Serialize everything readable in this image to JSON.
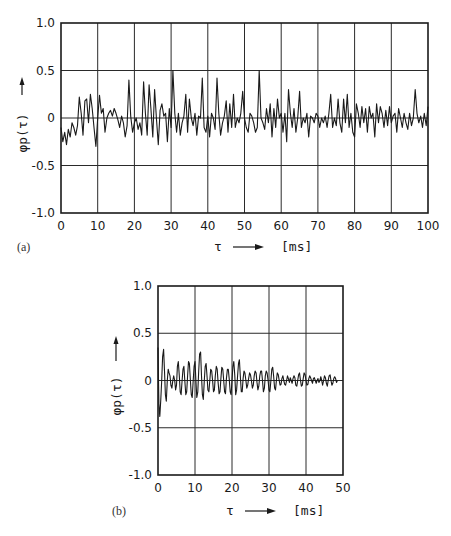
{
  "chart_data": [
    {
      "id": "a",
      "type": "line",
      "panel_label": "(a)",
      "title": "",
      "xlabel": "τ",
      "xunit": "[ms]",
      "ylabel": "φp(τ)",
      "xlim": [
        0,
        100
      ],
      "ylim": [
        -1.0,
        1.0
      ],
      "xticks": [
        0,
        10,
        20,
        30,
        40,
        50,
        60,
        70,
        80,
        90,
        100
      ],
      "xtick_labels": [
        "0",
        "10",
        "20",
        "30",
        "40",
        "50",
        "60",
        "70",
        "80",
        "90",
        "100"
      ],
      "yticks": [
        1.0,
        0.5,
        0,
        -0.5,
        -1.0
      ],
      "ytick_labels": [
        "1.0",
        "0.5",
        "0",
        "-0.5",
        "-1.0"
      ],
      "grid": true,
      "legend": "none",
      "series": [
        {
          "name": "φp(τ)",
          "x_step": 0.5,
          "values": [
            -0.1,
            -0.25,
            -0.15,
            -0.28,
            -0.12,
            -0.2,
            -0.05,
            -0.1,
            -0.18,
            -0.08,
            0.22,
            0.05,
            -0.18,
            0.18,
            0.2,
            -0.05,
            0.25,
            0.1,
            -0.1,
            -0.3,
            0.0,
            0.24,
            0.05,
            0.1,
            -0.15,
            0.0,
            0.05,
            0.08,
            0.02,
            0.1,
            0.05,
            -0.02,
            -0.1,
            0.02,
            -0.05,
            -0.2,
            -0.08,
            0.4,
            0.02,
            -0.15,
            -0.05,
            0.0,
            -0.12,
            -0.05,
            -0.18,
            0.38,
            0.05,
            -0.18,
            0.35,
            0.1,
            -0.2,
            0.3,
            0.0,
            -0.28,
            0.08,
            0.15,
            0.02,
            0.05,
            -0.25,
            0.1,
            -0.1,
            0.5,
            0.05,
            -0.15,
            0.05,
            -0.18,
            -0.05,
            0.02,
            0.25,
            -0.15,
            0.2,
            0.0,
            -0.08,
            0.05,
            -0.18,
            0.02,
            0.0,
            0.42,
            -0.1,
            -0.15,
            0.02,
            -0.2,
            0.05,
            0.0,
            -0.12,
            0.42,
            0.05,
            -0.18,
            -0.05,
            0.02,
            0.18,
            -0.15,
            0.15,
            -0.1,
            0.25,
            -0.1,
            0.0,
            -0.05,
            0.05,
            0.28,
            0.0,
            -0.1,
            -0.15,
            0.05,
            0.02,
            -0.05,
            -0.15,
            -0.1,
            0.5,
            0.0,
            -0.05,
            -0.12,
            0.1,
            -0.05,
            0.15,
            -0.2,
            0.1,
            -0.1,
            0.2,
            0.0,
            0.05,
            -0.15,
            0.05,
            -0.25,
            0.3,
            0.05,
            -0.1,
            0.1,
            -0.15,
            0.0,
            0.28,
            -0.1,
            0.0,
            -0.05,
            0.05,
            -0.2,
            0.02,
            0.0,
            -0.05,
            0.05,
            0.02,
            -0.1,
            0.0,
            -0.05,
            0.02,
            -0.1,
            0.05,
            0.25,
            -0.1,
            0.0,
            -0.08,
            0.2,
            -0.05,
            -0.15,
            0.2,
            -0.05,
            0.25,
            -0.1,
            0.05,
            -0.15,
            -0.2,
            0.15,
            0.05,
            -0.1,
            0.12,
            -0.05,
            0.1,
            -0.15,
            0.12,
            0.0,
            0.05,
            -0.2,
            0.15,
            -0.05,
            0.12,
            0.05,
            -0.1,
            0.08,
            -0.08,
            0.12,
            -0.05,
            0.02,
            0.05,
            -0.15,
            0.1,
            0.0,
            -0.1,
            0.05,
            -0.05,
            -0.12,
            0.05,
            -0.08,
            0.0,
            0.3,
            0.05,
            -0.05,
            0.02,
            -0.1,
            0.05,
            -0.08,
            0.12,
            -0.02,
            0.0,
            0.12,
            -0.05,
            -0.1,
            0.08,
            -0.05,
            0.02,
            -0.15,
            0.1,
            0.0,
            -0.08,
            0.05,
            0.0,
            -0.05,
            0.2,
            0.05,
            -0.05,
            0.1,
            -0.1,
            0.05,
            -0.02,
            0.08,
            -0.05,
            0.1,
            0.0,
            -0.1,
            0.08,
            -0.05,
            0.05,
            0.0,
            -0.08,
            0.08,
            -0.02,
            0.05,
            -0.05,
            0.0,
            0.08,
            -0.08,
            0.05,
            0.0,
            -0.05,
            0.1,
            -0.02,
            0.0,
            -0.08,
            0.08,
            -0.05,
            0.05,
            0.0,
            -0.05,
            0.05,
            -0.08,
            0.02,
            -0.1
          ],
          "color": "#1a1a1a"
        }
      ]
    },
    {
      "id": "b",
      "type": "line",
      "panel_label": "(b)",
      "title": "",
      "xlabel": "τ",
      "xunit": "[ms]",
      "ylabel": "φp(τ)",
      "xlim": [
        0,
        50
      ],
      "ylim": [
        -1.0,
        1.0
      ],
      "xticks": [
        0,
        10,
        20,
        30,
        40,
        50
      ],
      "xtick_labels": [
        "0",
        "10",
        "20",
        "30",
        "40",
        "50"
      ],
      "yticks": [
        1.0,
        0.5,
        0,
        -0.5,
        -1.0
      ],
      "ytick_labels": [
        "1.0",
        "0.5",
        "0",
        "-0.5",
        "-1.0"
      ],
      "grid": true,
      "legend": "none",
      "series": [
        {
          "name": "φp(τ)",
          "x_step": 0.25,
          "values": [
            0.35,
            -0.25,
            -0.38,
            -0.2,
            0.0,
            0.25,
            0.33,
            0.1,
            -0.15,
            -0.22,
            0.0,
            0.12,
            0.08,
            0.05,
            -0.05,
            -0.08,
            0.0,
            0.05,
            0.0,
            -0.1,
            -0.05,
            0.15,
            0.2,
            0.05,
            -0.12,
            -0.15,
            0.0,
            0.12,
            0.15,
            0.0,
            -0.15,
            -0.12,
            0.05,
            0.2,
            0.18,
            0.0,
            -0.15,
            -0.18,
            0.0,
            0.15,
            0.2,
            0.0,
            -0.18,
            -0.12,
            0.1,
            0.28,
            0.3,
            0.05,
            -0.15,
            -0.2,
            0.0,
            0.15,
            0.18,
            0.05,
            -0.1,
            -0.12,
            0.0,
            0.12,
            0.1,
            0.0,
            -0.12,
            -0.1,
            0.05,
            0.15,
            0.12,
            -0.02,
            -0.14,
            -0.12,
            0.02,
            0.14,
            0.12,
            0.0,
            -0.12,
            -0.14,
            0.02,
            0.12,
            0.12,
            0.02,
            -0.12,
            -0.15,
            0.0,
            0.15,
            0.2,
            0.05,
            -0.15,
            -0.1,
            0.05,
            0.18,
            0.22,
            0.05,
            -0.12,
            -0.12,
            0.02,
            0.1,
            0.08,
            0.0,
            -0.08,
            -0.05,
            0.02,
            0.08,
            0.06,
            0.0,
            -0.08,
            -0.05,
            0.05,
            0.1,
            0.08,
            -0.02,
            -0.1,
            -0.06,
            0.05,
            0.1,
            0.1,
            0.0,
            -0.12,
            -0.08,
            0.05,
            0.1,
            0.08,
            0.0,
            -0.1,
            -0.12,
            0.0,
            0.12,
            0.14,
            0.05,
            -0.08,
            -0.1,
            0.0,
            0.08,
            0.06,
            0.0,
            -0.05,
            -0.04,
            0.02,
            0.05,
            0.0,
            -0.04,
            -0.05,
            0.0,
            0.05,
            0.02,
            -0.02,
            0.03,
            0.0,
            -0.03,
            0.02,
            0.05,
            0.03,
            -0.05,
            -0.06,
            0.0,
            0.06,
            0.08,
            0.0,
            -0.06,
            -0.05,
            0.02,
            0.08,
            0.06,
            0.0,
            -0.05,
            -0.04,
            0.02,
            0.05,
            0.03,
            0.0,
            -0.03,
            0.02,
            0.03,
            0.0,
            -0.03,
            0.0,
            0.02,
            -0.02,
            0.0,
            0.04,
            0.0,
            -0.05,
            0.0,
            0.05,
            0.03,
            -0.03,
            -0.06,
            0.0,
            0.05,
            0.06,
            0.0,
            -0.05,
            -0.03,
            0.02,
            0.04,
            0.02,
            -0.02,
            0.0
          ],
          "color": "#1a1a1a"
        }
      ]
    }
  ]
}
